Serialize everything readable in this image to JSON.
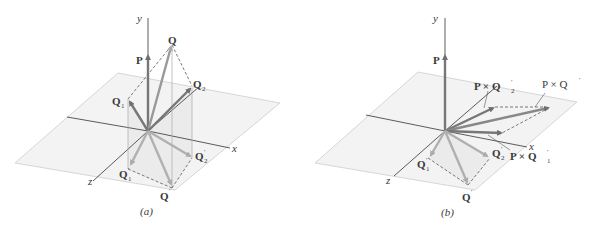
{
  "figure": {
    "panels": [
      {
        "id": "a",
        "caption": "(a)",
        "axes": {
          "x": "x",
          "y": "y",
          "z": "z"
        },
        "vectors": [
          {
            "name": "P",
            "label": "P",
            "sub": ""
          },
          {
            "name": "Q",
            "label": "Q",
            "sub": ""
          },
          {
            "name": "Q1",
            "label": "Q",
            "sub": "1"
          },
          {
            "name": "Q2",
            "label": "Q",
            "sub": "2"
          },
          {
            "name": "Q1prime",
            "label": "Q",
            "sub": "1",
            "prime": "′"
          },
          {
            "name": "Q2prime",
            "label": "Q",
            "sub": "2",
            "prime": "′"
          },
          {
            "name": "Qprime",
            "label": "Q",
            "sub": "",
            "prime": "′"
          }
        ]
      },
      {
        "id": "b",
        "caption": "(b)",
        "axes": {
          "x": "x",
          "y": "y",
          "z": "z"
        },
        "vectors": [
          {
            "name": "P",
            "label": "P"
          },
          {
            "name": "PxQ2prime",
            "label": "P × Q",
            "sub": "2",
            "prime": "′"
          },
          {
            "name": "PxQprime",
            "label": "P × Q",
            "prime": "′"
          },
          {
            "name": "PxQ1prime",
            "label": "P × Q",
            "sub": "1",
            "prime": "′"
          },
          {
            "name": "Q1prime",
            "label": "Q",
            "sub": "1",
            "prime": "′"
          },
          {
            "name": "Q2prime",
            "label": "Q",
            "sub": "2",
            "prime": "′"
          },
          {
            "name": "Qprime",
            "label": "Q",
            "prime": "′"
          }
        ]
      }
    ],
    "colors": {
      "plane_fill": "#f2f2f2",
      "plane_edge": "#cfcfcf",
      "axis": "#2f2f2f",
      "vector_dark": "#7a7a7a",
      "vector_light": "#b4b4b4",
      "dashed": "#444444",
      "label": "#3a3a3a"
    }
  }
}
